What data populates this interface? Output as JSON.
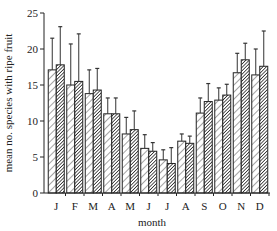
{
  "chart_data": {
    "type": "bar",
    "title": "",
    "xlabel": "month",
    "ylabel": "mean no. species with ripe fruit",
    "ylim": [
      0,
      25
    ],
    "yticks": [
      0,
      5,
      10,
      15,
      20,
      25
    ],
    "grid": false,
    "legend": null,
    "categories": [
      "J",
      "F",
      "M",
      "A",
      "M",
      "J",
      "J",
      "A",
      "S",
      "O",
      "N",
      "D"
    ],
    "series": [
      {
        "name": "series-1 (light hatch)",
        "pattern": "light-diagonal-hatch",
        "values": [
          17.1,
          15.0,
          13.8,
          11.0,
          8.2,
          6.2,
          4.6,
          7.2,
          11.1,
          12.9,
          16.7,
          16.4
        ],
        "error_upper": [
          21.5,
          20.7,
          17.1,
          13.2,
          10.5,
          8.1,
          6.0,
          8.2,
          13.2,
          14.6,
          19.4,
          20.0
        ]
      },
      {
        "name": "series-2 (dense hatch)",
        "pattern": "dense-diagonal-hatch",
        "values": [
          17.8,
          15.5,
          14.3,
          11.0,
          8.8,
          5.8,
          4.1,
          6.9,
          12.7,
          13.6,
          18.5,
          17.6
        ],
        "error_upper": [
          23.1,
          22.1,
          17.3,
          13.2,
          11.4,
          7.0,
          6.3,
          7.9,
          15.2,
          15.1,
          20.8,
          22.5
        ]
      }
    ]
  },
  "colors": {
    "axis": "#222222",
    "bar_outline": "#222222",
    "light_fill": "#ffffff",
    "dense_fill": "#333333"
  }
}
